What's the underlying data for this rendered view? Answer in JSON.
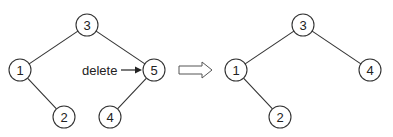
{
  "diagram": {
    "before": {
      "nodes": [
        {
          "id": "b3",
          "label": "3",
          "x": 87,
          "y": 25
        },
        {
          "id": "b1",
          "label": "1",
          "x": 20,
          "y": 70
        },
        {
          "id": "b5",
          "label": "5",
          "x": 154,
          "y": 70
        },
        {
          "id": "b2",
          "label": "2",
          "x": 64,
          "y": 117
        },
        {
          "id": "b4",
          "label": "4",
          "x": 110,
          "y": 117
        }
      ],
      "edges": [
        [
          "b3",
          "b1"
        ],
        [
          "b3",
          "b5"
        ],
        [
          "b1",
          "b2"
        ],
        [
          "b5",
          "b4"
        ]
      ]
    },
    "annotation": {
      "label": "delete",
      "target": "5"
    },
    "transition_arrow": "right-arrow",
    "after": {
      "nodes": [
        {
          "id": "a3",
          "label": "3",
          "x": 303,
          "y": 25
        },
        {
          "id": "a1",
          "label": "1",
          "x": 236,
          "y": 70
        },
        {
          "id": "a4",
          "label": "4",
          "x": 370,
          "y": 70
        },
        {
          "id": "a2",
          "label": "2",
          "x": 280,
          "y": 117
        }
      ],
      "edges": [
        [
          "a3",
          "a1"
        ],
        [
          "a3",
          "a4"
        ],
        [
          "a1",
          "a2"
        ]
      ]
    }
  }
}
